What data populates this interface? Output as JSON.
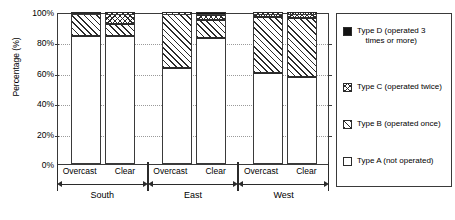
{
  "chart_data": {
    "type": "bar",
    "subtype": "100% stacked bar",
    "title": "",
    "xlabel": "",
    "ylabel": "Percentage (%)",
    "ylim": [
      0,
      100
    ],
    "ytick_labels": [
      "0%",
      "20%",
      "40%",
      "60%",
      "80%",
      "100%"
    ],
    "ytick_values": [
      0,
      20,
      40,
      60,
      80,
      100
    ],
    "grid": "horizontal dotted gridlines",
    "legend_position": "right outside",
    "groups": [
      "South",
      "East",
      "West"
    ],
    "conditions": [
      "Overcast",
      "Clear"
    ],
    "categories": [
      "South Overcast",
      "South Clear",
      "East Overcast",
      "East Clear",
      "West Overcast",
      "West Clear"
    ],
    "series": [
      {
        "name": "Type A (not operated)",
        "key": "A",
        "fill": "white",
        "values": [
          84,
          84,
          63,
          83,
          60,
          57
        ]
      },
      {
        "name": "Type B (operated once)",
        "key": "B",
        "fill": "diagonal hatch",
        "values": [
          15,
          8,
          37,
          12,
          37,
          39
        ]
      },
      {
        "name": "Type C (operated twice)",
        "key": "C",
        "fill": "cross hatch",
        "values": [
          1,
          8,
          0,
          3,
          3,
          4
        ]
      },
      {
        "name": "Type D (operated 3 times or more)",
        "key": "D",
        "fill": "solid black",
        "values": [
          0,
          0,
          0,
          2,
          0,
          0
        ]
      }
    ]
  },
  "axis": {
    "y_title": "Percentage (%)",
    "y_ticks": [
      "100%",
      "80%",
      "60%",
      "40%",
      "20%",
      "0%"
    ]
  },
  "xaxis": {
    "groups": [
      {
        "name": "South",
        "conditions": [
          "Overcast",
          "Clear"
        ]
      },
      {
        "name": "East",
        "conditions": [
          "Overcast",
          "Clear"
        ]
      },
      {
        "name": "West",
        "conditions": [
          "Overcast",
          "Clear"
        ]
      }
    ]
  },
  "legend": {
    "items": [
      {
        "key": "D",
        "line1": "Type D (operated 3",
        "line2": "times or more)"
      },
      {
        "key": "C",
        "line1": "Type C (operated twice)",
        "line2": ""
      },
      {
        "key": "B",
        "line1": "Type B (operated once)",
        "line2": ""
      },
      {
        "key": "A",
        "line1": "Type A (not operated)",
        "line2": ""
      }
    ]
  },
  "colors": {
    "ink": "#2b2b2b",
    "frame": "#3a3a3a",
    "grid": "#9a9a9a",
    "background": "#ffffff",
    "type_d": "#121212"
  }
}
